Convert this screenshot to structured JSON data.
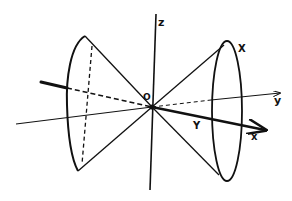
{
  "diagram": {
    "labels": {
      "z_axis": "z",
      "y_axis": "y",
      "x_axis": "x",
      "origin": "O",
      "point_X": "X",
      "point_Y": "Y"
    },
    "colors": {
      "ink": "#111111",
      "background": "#ffffff"
    }
  }
}
